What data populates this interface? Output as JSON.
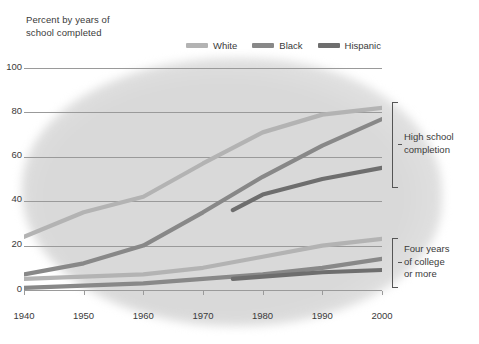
{
  "axis_title": "Percent by years of\nschool completed",
  "axis_title_line1": "Percent by years of",
  "axis_title_line2": "school completed",
  "colors": {
    "white_series": "#b3b3b3",
    "black_series": "#888888",
    "hispanic_series": "#6e6e6e",
    "gridline": "#9a9a9a",
    "text": "#3a3a3a",
    "background_blob": "#d9d9d9"
  },
  "legend": {
    "items": [
      {
        "label": "White",
        "color": "#b3b3b3"
      },
      {
        "label": "Black",
        "color": "#888888"
      },
      {
        "label": "Hispanic",
        "color": "#6e6e6e"
      }
    ]
  },
  "annotations": [
    {
      "id": "high-school",
      "line1": "High school",
      "line2": "completion",
      "line3": ""
    },
    {
      "id": "college",
      "line1": "Four years",
      "line2": "of college",
      "line3": "or more"
    }
  ],
  "y_ticks": [
    "0",
    "20",
    "40",
    "60",
    "80",
    "100"
  ],
  "x_ticks": [
    "1940",
    "1950",
    "1960",
    "1970",
    "1980",
    "1990",
    "2000"
  ],
  "chart_data": {
    "type": "line",
    "title": "Percent by years of school completed",
    "xlabel": "",
    "ylabel": "Percent by years of school completed",
    "xlim": [
      1940,
      2000
    ],
    "ylim": [
      0,
      100
    ],
    "x": [
      1940,
      1950,
      1960,
      1970,
      1980,
      1990,
      2000
    ],
    "grid": true,
    "legend_position": "top-right",
    "groups": [
      {
        "name": "High school completion",
        "series": [
          {
            "name": "White",
            "color": "#b3b3b3",
            "x": [
              1940,
              1950,
              1960,
              1970,
              1980,
              1990,
              2000
            ],
            "values": [
              24,
              35,
              42,
              57,
              71,
              79,
              82
            ]
          },
          {
            "name": "Black",
            "color": "#888888",
            "x": [
              1940,
              1950,
              1960,
              1970,
              1980,
              1990,
              2000
            ],
            "values": [
              7,
              12,
              20,
              35,
              51,
              65,
              77
            ]
          },
          {
            "name": "Hispanic",
            "color": "#6e6e6e",
            "x": [
              1975,
              1980,
              1990,
              2000
            ],
            "values": [
              36,
              43,
              50,
              55
            ]
          }
        ]
      },
      {
        "name": "Four years of college or more",
        "series": [
          {
            "name": "White",
            "color": "#b3b3b3",
            "x": [
              1940,
              1950,
              1960,
              1970,
              1980,
              1990,
              2000
            ],
            "values": [
              5,
              6,
              7,
              10,
              15,
              20,
              23
            ]
          },
          {
            "name": "Black",
            "color": "#888888",
            "x": [
              1940,
              1950,
              1960,
              1970,
              1980,
              1990,
              2000
            ],
            "values": [
              1,
              2,
              3,
              5,
              7,
              10,
              14
            ]
          },
          {
            "name": "Hispanic",
            "color": "#6e6e6e",
            "x": [
              1975,
              1980,
              1990,
              2000
            ],
            "values": [
              5,
              6,
              8,
              9
            ]
          }
        ]
      }
    ]
  }
}
